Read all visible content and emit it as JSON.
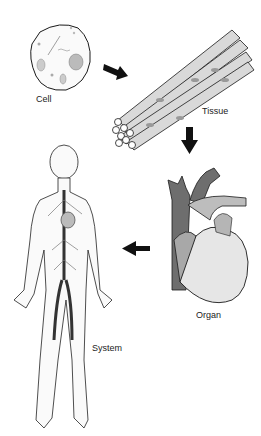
{
  "diagram": {
    "stages": [
      {
        "id": "cell",
        "label": "Cell"
      },
      {
        "id": "tissue",
        "label": "Tissue"
      },
      {
        "id": "organ",
        "label": "Organ"
      },
      {
        "id": "system",
        "label": "System"
      }
    ],
    "arrows": [
      {
        "from": "cell",
        "to": "tissue",
        "direction": "down-right"
      },
      {
        "from": "tissue",
        "to": "organ",
        "direction": "down"
      },
      {
        "from": "organ",
        "to": "system",
        "direction": "left"
      }
    ],
    "colors": {
      "outline": "#1a1a1a",
      "arrow": "#111111",
      "dark_vessel": "#6a6a6a",
      "mid_gray": "#9a9a9a",
      "light_gray": "#d8d8d8"
    }
  }
}
